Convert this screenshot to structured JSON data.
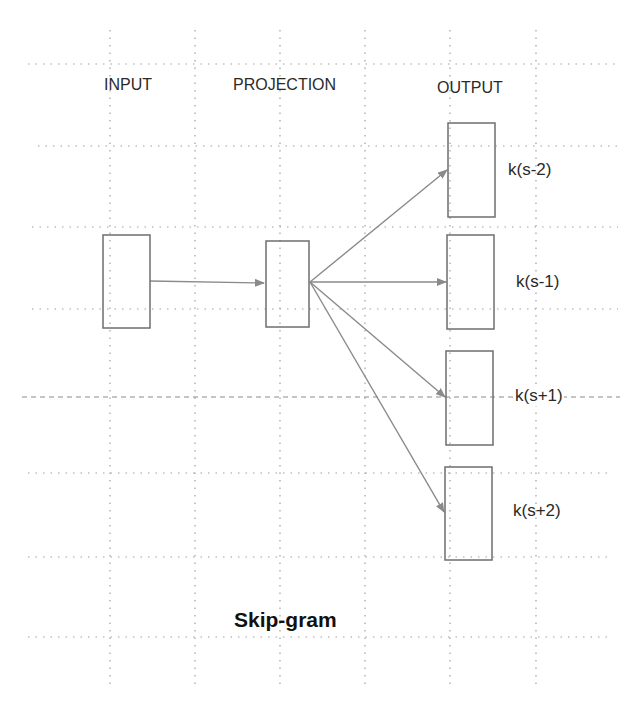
{
  "diagram": {
    "title": "Skip-gram",
    "columns": {
      "input": "INPUT",
      "projection": "PROJECTION",
      "output": "OUTPUT"
    },
    "nodes": [
      {
        "id": "input",
        "label": "",
        "x": 103,
        "y": 235,
        "w": 47,
        "h": 93
      },
      {
        "id": "projection",
        "label": "",
        "x": 266,
        "y": 241,
        "w": 43,
        "h": 86
      },
      {
        "id": "out1",
        "label": "k(s-2)",
        "x": 448,
        "y": 123,
        "w": 47,
        "h": 94
      },
      {
        "id": "out2",
        "label": "k(s-1)",
        "x": 447,
        "y": 235,
        "w": 47,
        "h": 94
      },
      {
        "id": "out3",
        "label": "k(s+1)",
        "x": 446,
        "y": 351,
        "w": 47,
        "h": 94
      },
      {
        "id": "out4",
        "label": "k(s+2)",
        "x": 445,
        "y": 467,
        "w": 47,
        "h": 93
      }
    ],
    "edges": [
      {
        "from": "input",
        "to": "projection"
      },
      {
        "from": "projection",
        "to": "out1"
      },
      {
        "from": "projection",
        "to": "out2"
      },
      {
        "from": "projection",
        "to": "out3"
      },
      {
        "from": "projection",
        "to": "out4"
      }
    ],
    "output_labels": [
      "k(s-2)",
      "k(s-1)",
      "k(s+1)",
      "k(s+2)"
    ],
    "colors": {
      "box_stroke": "#6e6e6e",
      "arrow": "#8a8a8a",
      "grid": "#9a9a9a",
      "text": "#2a2a2a"
    },
    "grid": {
      "horizontal_y": [
        64,
        146,
        227,
        309,
        397,
        473,
        557,
        637
      ],
      "vertical_x": [
        110,
        195,
        280,
        365,
        450,
        536
      ]
    }
  }
}
